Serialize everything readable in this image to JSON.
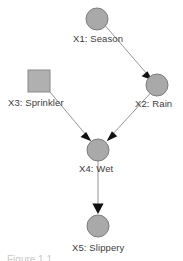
{
  "figure": {
    "caption_partial": "Figure 1.1",
    "background_color": "#ffffff"
  },
  "style": {
    "node_fill": "#a9a9a9",
    "node_stroke": "#7d7d7d",
    "edge_color": "#8a8a8a",
    "arrowhead_color": "#000000",
    "label_color": "#3d3d3d"
  },
  "graph": {
    "type": "directed-acyclic-graph",
    "nodes": [
      {
        "id": "X1",
        "label": "X1: Season",
        "shape": "circle",
        "cx": 97,
        "cy": 19,
        "r": 11
      },
      {
        "id": "X3",
        "label": "X3: Sprinkler",
        "shape": "square",
        "cx": 39,
        "cy": 81,
        "size": 22
      },
      {
        "id": "X2",
        "label": "X2: Rain",
        "shape": "circle",
        "cx": 157,
        "cy": 85,
        "r": 11
      },
      {
        "id": "X4",
        "label": "X4: Wet",
        "shape": "circle",
        "cx": 98,
        "cy": 150,
        "r": 11
      },
      {
        "id": "X5",
        "label": "X5: Slippery",
        "shape": "circle",
        "cx": 98,
        "cy": 226,
        "r": 11
      }
    ],
    "edges": [
      {
        "from": "X1",
        "to": "X2"
      },
      {
        "from": "X3",
        "to": "X4"
      },
      {
        "from": "X2",
        "to": "X4"
      },
      {
        "from": "X4",
        "to": "X5"
      }
    ]
  }
}
